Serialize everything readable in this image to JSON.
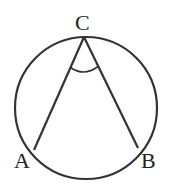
{
  "diagram": {
    "type": "inscribed-angle",
    "points": {
      "C": {
        "label": "C",
        "x": 84,
        "y": 37
      },
      "A": {
        "label": "A",
        "x": 34,
        "y": 150
      },
      "B": {
        "label": "B",
        "x": 138,
        "y": 148
      }
    },
    "circle": {
      "cx": 86,
      "cy": 108,
      "r": 71
    },
    "stroke_color": "#333333",
    "angle_marker": "angle ACB"
  }
}
